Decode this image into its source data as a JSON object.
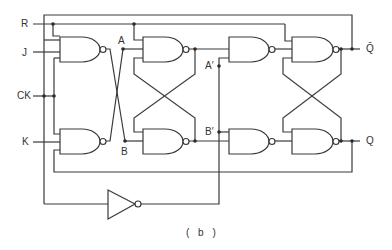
{
  "diagram": {
    "caption": "( b )",
    "inputs": {
      "reset": "R",
      "j": "J",
      "clock": "CK",
      "k": "K"
    },
    "outputs": {
      "q_bar": "Q̄",
      "q": "Q"
    },
    "nodes": {
      "a": "A",
      "b": "B",
      "a_prime": "A′",
      "b_prime": "B′"
    },
    "components": [
      {
        "id": "g1",
        "type": "NAND",
        "role": "J input gate"
      },
      {
        "id": "g2",
        "type": "NAND",
        "role": "K input gate"
      },
      {
        "id": "g3",
        "type": "NAND",
        "role": "master latch top"
      },
      {
        "id": "g4",
        "type": "NAND",
        "role": "master latch bottom"
      },
      {
        "id": "g5",
        "type": "NAND",
        "role": "slave steering top"
      },
      {
        "id": "g6",
        "type": "NAND",
        "role": "slave steering bottom"
      },
      {
        "id": "g7",
        "type": "NAND",
        "role": "slave latch Q̄"
      },
      {
        "id": "g8",
        "type": "NAND",
        "role": "slave latch Q"
      },
      {
        "id": "inv",
        "type": "NOT",
        "role": "clock inverter"
      }
    ],
    "colors": {
      "line": "#3a3a3a",
      "background": "#ffffff"
    }
  }
}
